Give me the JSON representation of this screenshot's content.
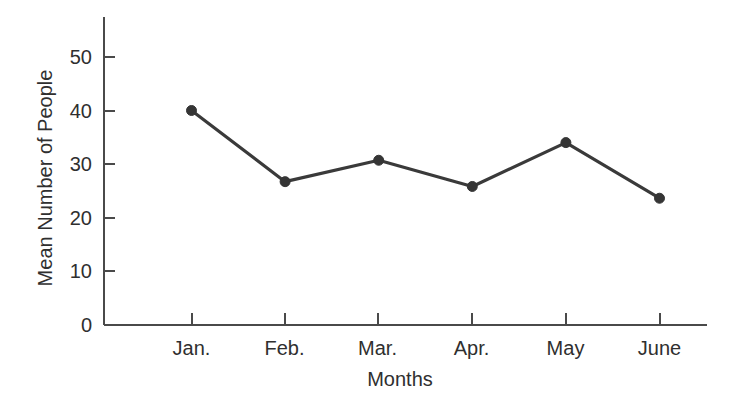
{
  "chart_data": {
    "type": "line",
    "title": "",
    "subtitle": "",
    "xlabel": "Months",
    "ylabel": "Mean Number of People",
    "categories": [
      "Jan.",
      "Feb.",
      "Mar.",
      "Apr.",
      "May",
      "June"
    ],
    "values": [
      40.0,
      26.7,
      30.7,
      25.8,
      34.0,
      23.6
    ],
    "series": [
      {
        "name": "Mean Number of People",
        "values": [
          40.0,
          26.7,
          30.7,
          25.8,
          34.0,
          23.6
        ]
      }
    ],
    "ylim": [
      0,
      55
    ],
    "yticks": [
      0,
      10,
      20,
      30,
      40,
      50
    ],
    "ytick_labels": [
      "0",
      "10",
      "20",
      "30",
      "40",
      "50"
    ],
    "xticks": [
      "Jan.",
      "Feb.",
      "Mar.",
      "Apr.",
      "May",
      "June"
    ],
    "grid": false,
    "legend": false,
    "legend_position": "none",
    "marker": "filled-circle",
    "line_color": "#3a3a3a",
    "marker_color": "#353535",
    "axis_color": "#4a4a4a",
    "background_color": "#ffffff",
    "annotations": []
  },
  "axes": {
    "y_tick_0": "0",
    "y_tick_1": "10",
    "y_tick_2": "20",
    "y_tick_3": "30",
    "y_tick_4": "40",
    "y_tick_5": "50",
    "x_tick_0": "Jan.",
    "x_tick_1": "Feb.",
    "x_tick_2": "Mar.",
    "x_tick_3": "Apr.",
    "x_tick_4": "May",
    "x_tick_5": "June",
    "x_title": "Months",
    "y_title": "Mean Number of People"
  }
}
